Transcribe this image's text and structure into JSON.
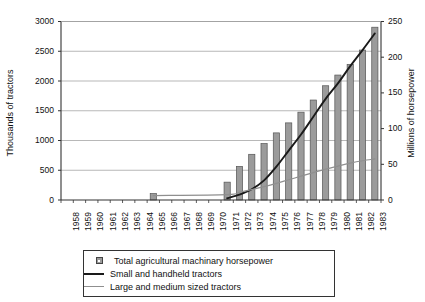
{
  "chart_data": {
    "type": "bar",
    "title": "",
    "subtitle": "",
    "xlabel": "",
    "ylabel": "Thousands of tractors",
    "ylabel_right": "Millions of horsepower",
    "ylim": [
      0,
      3000
    ],
    "ylim_right": [
      0,
      250
    ],
    "yticks": [
      "0",
      "500",
      "1000",
      "1500",
      "2000",
      "2500",
      "3000"
    ],
    "ytick_values": [
      0,
      500,
      1000,
      1500,
      2000,
      2500,
      3000
    ],
    "yticks_right": [
      "0",
      "50",
      "100",
      "150",
      "200",
      "250"
    ],
    "ytick_values_right": [
      0,
      50,
      100,
      150,
      200,
      250
    ],
    "grid": true,
    "legend_position": "below-plot",
    "categories": [
      "1958",
      "1959",
      "1960",
      "1961",
      "1962",
      "1963",
      "1964",
      "1965",
      "1966",
      "1967",
      "1968",
      "1969",
      "1970",
      "1971",
      "1972",
      "1973",
      "1974",
      "1975",
      "1976",
      "1977",
      "1978",
      "1979",
      "1980",
      "1981",
      "1982",
      "1983"
    ],
    "series": [
      {
        "name": "Total agricultural machinary horsepower",
        "type": "bar",
        "axis": "right",
        "unit": "Millions of horsepower",
        "color": "#9b9b9b",
        "edge_color": "#555555",
        "values": [
          null,
          null,
          null,
          null,
          null,
          null,
          null,
          9,
          null,
          null,
          null,
          null,
          null,
          25,
          47,
          64,
          79,
          94,
          108,
          123,
          140,
          160,
          175,
          190,
          210,
          242
        ]
      },
      {
        "name": "Small and handheld tractors",
        "type": "line",
        "axis": "left",
        "unit": "Thousands of tractors",
        "color": "#1a1a1a",
        "values": [
          null,
          null,
          null,
          null,
          null,
          null,
          null,
          null,
          null,
          null,
          null,
          null,
          null,
          30,
          90,
          180,
          330,
          560,
          830,
          1100,
          1400,
          1700,
          1960,
          2250,
          2520,
          2800
        ]
      },
      {
        "name": "Large and medium sized tractors",
        "type": "line",
        "axis": "left",
        "unit": "Thousands of tractors",
        "color": "#8f8f8f",
        "values": [
          null,
          null,
          null,
          null,
          null,
          null,
          null,
          75,
          null,
          null,
          null,
          null,
          null,
          90,
          130,
          175,
          225,
          280,
          340,
          400,
          460,
          520,
          570,
          620,
          660,
          690
        ]
      }
    ],
    "legend": [
      {
        "label": "Total agricultural machinary horsepower",
        "marker": "square-swatch",
        "color": "#9b9b9b"
      },
      {
        "label": "Small and handheld tractors",
        "marker": "line-dark",
        "color": "#1a1a1a"
      },
      {
        "label": "Large and medium sized tractors",
        "marker": "line-gray",
        "color": "#8f8f8f"
      }
    ]
  }
}
